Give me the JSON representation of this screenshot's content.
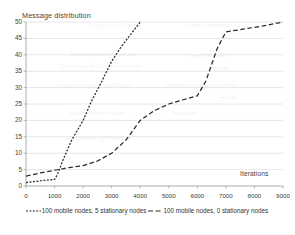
{
  "chart_data": {
    "type": "line",
    "title": "",
    "xlabel": "Iterations",
    "ylabel": "Message distribution",
    "xlim": [
      0,
      9000
    ],
    "ylim": [
      0,
      50
    ],
    "xticks": [
      0,
      1000,
      2000,
      3000,
      4000,
      5000,
      6000,
      7000,
      8000,
      9000
    ],
    "yticks": [
      0,
      5,
      10,
      15,
      20,
      25,
      30,
      35,
      40,
      45,
      50
    ],
    "xtick_labels": [
      "0",
      "1000",
      "2000",
      "3000",
      "4000",
      "5000",
      "6000",
      "7000",
      "8000",
      "9000"
    ],
    "ytick_labels": [
      "0",
      "5",
      "10",
      "15",
      "20",
      "25",
      "30",
      "35",
      "40",
      "45",
      "50"
    ],
    "grid": "horizontal",
    "legend_position": "bottom",
    "series": [
      {
        "name": "100 mobile nodes, 5 stationary nodes",
        "style": "dotted",
        "color": "#2b2b2b",
        "x": [
          0,
          500,
          1000,
          1100,
          1300,
          1600,
          2000,
          2300,
          2600,
          3000,
          3300,
          3600,
          4000
        ],
        "y": [
          1,
          1.6,
          2,
          3.5,
          8,
          14,
          20,
          26,
          31,
          38,
          42,
          45.5,
          50
        ]
      },
      {
        "name": "100 mobile nodes, 0 stationary nodes",
        "style": "dashed",
        "color": "#2b2b2b",
        "x": [
          0,
          500,
          1000,
          1500,
          2000,
          2500,
          3000,
          3500,
          4000,
          4500,
          5000,
          5500,
          6000,
          6300,
          6700,
          7000,
          7600,
          8300,
          9000
        ],
        "y": [
          3,
          4,
          4.8,
          5.6,
          6.2,
          7.6,
          10,
          14,
          20,
          23,
          25,
          26.3,
          27.5,
          32,
          42,
          47,
          47.8,
          48.8,
          50
        ]
      }
    ]
  },
  "ghost_text": [
    {
      "t": "Transaction to Disputed",
      "x": 88,
      "y": 22
    },
    {
      "t": "Defined Investigation",
      "x": 186,
      "y": 22
    },
    {
      "t": "Transaction Information",
      "x": 70,
      "y": 50
    },
    {
      "t": "Deposit Funding",
      "x": 188,
      "y": 52
    },
    {
      "t": "Correction of Transaction Entry",
      "x": 62,
      "y": 63
    },
    {
      "t": "It was",
      "x": 212,
      "y": 64
    },
    {
      "t": "Transaction Support and Dispute",
      "x": 58,
      "y": 82
    },
    {
      "t": "Handling Transaction Claims",
      "x": 166,
      "y": 82
    },
    {
      "t": "Actual",
      "x": 220,
      "y": 93
    },
    {
      "t": "Report Identified Claims",
      "x": 70,
      "y": 110
    },
    {
      "t": "Supported",
      "x": 172,
      "y": 110
    },
    {
      "t": "Monitoring and Review",
      "x": 66,
      "y": 134
    }
  ]
}
